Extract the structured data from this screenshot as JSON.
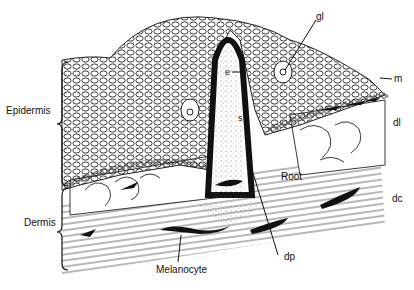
{
  "figure": {
    "type": "histological section illustration"
  },
  "labels": {
    "epidermis": "Epidermis",
    "dermis": "Dermis",
    "gl": "gl",
    "m": "m",
    "dl": "dl",
    "dc": "dc",
    "e": "e",
    "s": "s",
    "root": "Root",
    "dp": "dp",
    "melanocyte": "Melanocyte"
  }
}
